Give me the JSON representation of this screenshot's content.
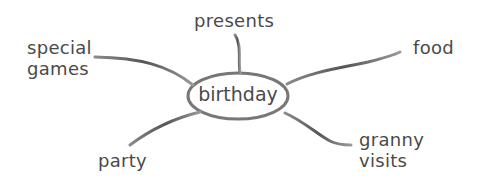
{
  "mind_map": {
    "center": "birthday",
    "branches": [
      {
        "label": "presents",
        "position": "top"
      },
      {
        "label": "special\ngames",
        "position": "top-left"
      },
      {
        "label": "food",
        "position": "top-right"
      },
      {
        "label": "party",
        "position": "bottom-left"
      },
      {
        "label": "granny\nvisits",
        "position": "bottom-right"
      }
    ]
  },
  "colors": {
    "line": "#6a6a6a",
    "text": "#4a4a4a"
  }
}
